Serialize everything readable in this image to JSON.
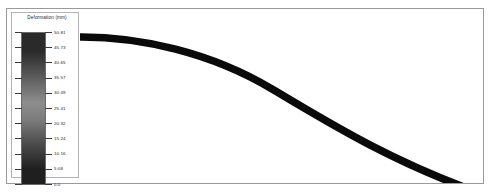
{
  "legend": {
    "title": "Deformation (mm)",
    "ticks": [
      {
        "value": "50.81"
      },
      {
        "value": "45.73"
      },
      {
        "value": "40.65"
      },
      {
        "value": "35.57"
      },
      {
        "value": "30.49"
      },
      {
        "value": "25.41"
      },
      {
        "value": "20.32"
      },
      {
        "value": "15.24"
      },
      {
        "value": "10.16"
      },
      {
        "value": "5.08"
      },
      {
        "value": "0.0"
      }
    ],
    "colorbar": {
      "top_color": "#2a2a2a",
      "mid_color": "#8d8d8d",
      "bottom_color": "#1f1f1f"
    }
  },
  "viewport": {
    "beam_color": "#0a0a0a",
    "background": "#ffffff"
  },
  "chart_data": {
    "type": "line",
    "title": "Deformation (mm)",
    "xlabel": "",
    "ylabel": "Deformation (mm)",
    "legend_position": "left",
    "grid": false,
    "colorbar_label": "Deformation (mm)",
    "colorbar_ticks": [
      50.81,
      45.73,
      40.65,
      35.57,
      30.49,
      25.41,
      20.32,
      15.24,
      10.16,
      5.08,
      0.0
    ],
    "colorbar_range": [
      0.0,
      50.81
    ],
    "colormap": "grayscale",
    "series": [
      {
        "name": "Deformed beam shape",
        "x": [
          0,
          10,
          20,
          30,
          40,
          50,
          60,
          70,
          80,
          90,
          100
        ],
        "y": [
          0.0,
          0.6,
          2.3,
          5.2,
          9.2,
          14.3,
          20.5,
          27.8,
          36.1,
          45.4,
          50.81
        ]
      }
    ]
  }
}
